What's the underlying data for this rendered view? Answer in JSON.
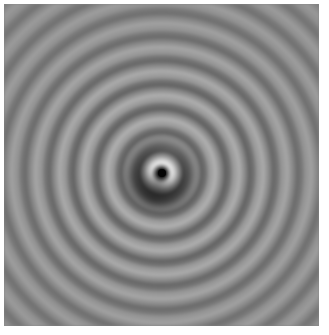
{
  "image": {
    "description": "Grayscale concentric ring interference pattern",
    "colors": {
      "background": "#ffffff",
      "base_gray": "#858585",
      "ring_light": "#b4b4b4",
      "ring_dark": "#5e5e5e",
      "center_dark": "#050505",
      "center_bright_ring": "#e6e6e6"
    }
  }
}
